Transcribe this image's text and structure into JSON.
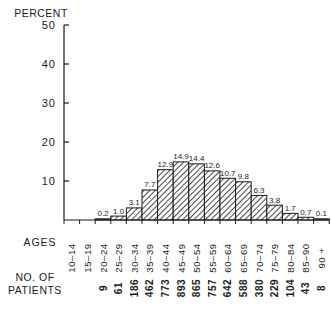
{
  "chart_data": {
    "type": "bar",
    "title": "",
    "ylabel": "PERCENT",
    "xlabel": "AGES",
    "ylim": [
      0,
      50
    ],
    "yticks": [
      10,
      20,
      30,
      40,
      50
    ],
    "grid": false,
    "legend": null,
    "categories": [
      "10-14",
      "15-19",
      "20-24",
      "25-29",
      "30-34",
      "35-39",
      "40-44",
      "45-49",
      "50-54",
      "55-59",
      "60-64",
      "65-69",
      "70-74",
      "75-79",
      "80-84",
      "85-90",
      "90 +"
    ],
    "values": [
      null,
      null,
      0.2,
      1.0,
      3.1,
      7.7,
      12.9,
      14.9,
      14.4,
      12.6,
      10.7,
      9.8,
      6.3,
      3.8,
      1.7,
      0.7,
      0.1
    ],
    "value_labels": [
      "",
      "",
      "0.2",
      "1.0",
      "3.1",
      "7.7",
      "12.9",
      "14.9",
      "14.4",
      "12.6",
      "10.7",
      "9.8",
      "6.3",
      "3.8",
      "1.7",
      "0.7",
      "0.1"
    ],
    "patients_label": "NO. OF PATIENTS",
    "patients": [
      "",
      "",
      "9",
      "61",
      "186",
      "462",
      "773",
      "893",
      "865",
      "757",
      "642",
      "588",
      "380",
      "229",
      "104",
      "43",
      "8"
    ],
    "bar_fill": "hatched",
    "ink_color": "#1a1a1a"
  },
  "labels": {
    "y_axis_title": "PERCENT",
    "ages_row_title": "AGES",
    "patients_row_title_line1": "NO. OF",
    "patients_row_title_line2": "PATIENTS"
  }
}
